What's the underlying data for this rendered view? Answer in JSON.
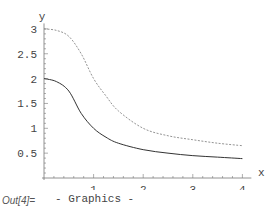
{
  "chart_data": {
    "type": "line",
    "title": "",
    "xlabel": "x",
    "ylabel": "y",
    "xlim": [
      0,
      4.1
    ],
    "ylim": [
      0,
      3.05
    ],
    "grid": false,
    "legend": null,
    "x_ticks": [
      "1",
      "2",
      "3",
      "4"
    ],
    "y_ticks": [
      "0.5",
      "1",
      "1.5",
      "2",
      "2.5",
      "3"
    ],
    "series": [
      {
        "name": "solid",
        "style": "solid",
        "x": [
          0,
          0.25,
          0.5,
          0.75,
          1.0,
          1.25,
          1.5,
          2.0,
          2.5,
          3.0,
          3.5,
          4.0
        ],
        "y": [
          2.0,
          1.94,
          1.75,
          1.3,
          1.0,
          0.82,
          0.7,
          0.57,
          0.5,
          0.45,
          0.42,
          0.39
        ]
      },
      {
        "name": "dashed",
        "style": "dashed",
        "x": [
          0,
          0.25,
          0.5,
          0.75,
          1.0,
          1.25,
          1.5,
          2.0,
          2.5,
          3.0,
          3.5,
          4.0
        ],
        "y": [
          3.0,
          2.97,
          2.85,
          2.5,
          2.0,
          1.65,
          1.35,
          1.0,
          0.85,
          0.77,
          0.7,
          0.65
        ]
      }
    ]
  },
  "output": {
    "label": "Out[4]=",
    "value": "- Graphics -"
  }
}
